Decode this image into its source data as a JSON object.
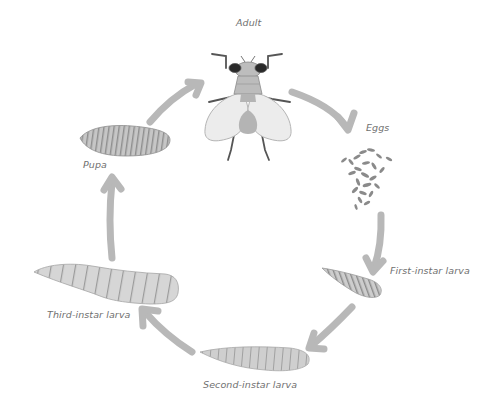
{
  "diagram": {
    "type": "life-cycle",
    "stages": [
      {
        "id": "adult",
        "label": "Adult"
      },
      {
        "id": "eggs",
        "label": "Eggs"
      },
      {
        "id": "first-instar",
        "label": "First-instar larva"
      },
      {
        "id": "second-instar",
        "label": "Second-instar larva"
      },
      {
        "id": "third-instar",
        "label": "Third-instar larva"
      },
      {
        "id": "pupa",
        "label": "Pupa"
      }
    ],
    "edges": [
      {
        "from": "adult",
        "to": "eggs"
      },
      {
        "from": "eggs",
        "to": "first-instar"
      },
      {
        "from": "first-instar",
        "to": "second-instar"
      },
      {
        "from": "second-instar",
        "to": "third-instar"
      },
      {
        "from": "third-instar",
        "to": "pupa"
      },
      {
        "from": "pupa",
        "to": "adult"
      }
    ]
  },
  "colors": {
    "arrow": "#b8b8b8",
    "body_fill": "#c9c9c9",
    "body_stroke": "#9a9a9a",
    "wing_fill": "#ececec",
    "eye": "#2a2a2a",
    "label_text": "#707070"
  }
}
